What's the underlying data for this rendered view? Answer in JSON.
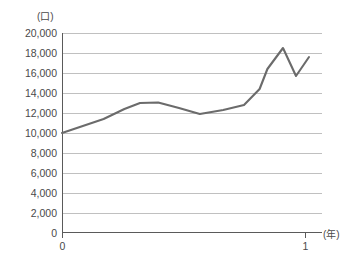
{
  "chart_data": {
    "type": "line",
    "title": "",
    "subtitle": "",
    "xlabel": "(年)",
    "ylabel": "(口)",
    "ylim": [
      0,
      20000
    ],
    "xlim": [
      0,
      1
    ],
    "grid": true,
    "legend": null,
    "y_ticks": [
      "0",
      "2,000",
      "4,000",
      "6,000",
      "8,000",
      "10,000",
      "12,000",
      "14,000",
      "16,000",
      "18,000",
      "20,000"
    ],
    "y_tick_values": [
      0,
      2000,
      4000,
      6000,
      8000,
      10000,
      12000,
      14000,
      16000,
      18000,
      20000
    ],
    "x_ticks": [
      "0",
      "1"
    ],
    "x_tick_values": [
      0,
      1
    ],
    "series": [
      {
        "name": "",
        "color": "#6b6b6b",
        "x": [
          0.0,
          0.08,
          0.16,
          0.24,
          0.3,
          0.37,
          0.45,
          0.53,
          0.62,
          0.7,
          0.76,
          0.79,
          0.85,
          0.9,
          0.95
        ],
        "values": [
          10000,
          10700,
          11400,
          12400,
          13000,
          13050,
          12500,
          11900,
          12300,
          12800,
          14400,
          16400,
          18500,
          15700,
          17600
        ]
      }
    ],
    "annotations": []
  },
  "axis": {
    "y_unit_label": "(口)",
    "x_unit_label": "(年)"
  }
}
